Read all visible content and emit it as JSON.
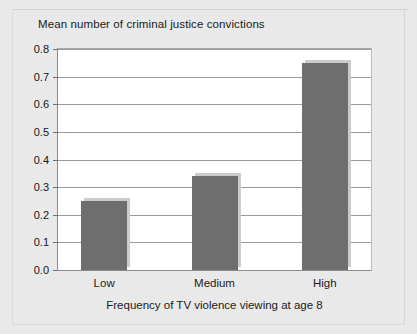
{
  "chart_data": {
    "type": "bar",
    "title": "Mean number of criminal justice convictions",
    "xlabel": "Frequency of TV violence viewing at age 8",
    "ylabel": "",
    "categories": [
      "Low",
      "Medium",
      "High"
    ],
    "values": [
      0.25,
      0.34,
      0.75
    ],
    "ylim": [
      0.0,
      0.8
    ],
    "ytick_labels": [
      "0.0",
      "0.1",
      "0.2",
      "0.3",
      "0.4",
      "0.5",
      "0.6",
      "0.7",
      "0.8"
    ],
    "ytick_values": [
      0.0,
      0.1,
      0.2,
      0.3,
      0.4,
      0.5,
      0.6,
      0.7,
      0.8
    ],
    "grid": true,
    "legend": null,
    "bar_color": "#6e6e6e",
    "shadow_color": "#cccccc",
    "plot_background": "#ffffff",
    "figure_background": "#e9e9e9"
  }
}
